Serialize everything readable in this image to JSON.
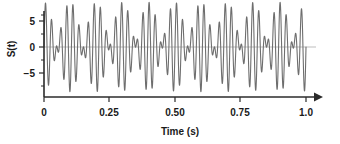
{
  "chart_data": {
    "type": "line",
    "title": "",
    "subtitle": "",
    "xlabel": "Time (s)",
    "ylabel": "S(t)",
    "xlim": [
      0,
      1.0
    ],
    "ylim": [
      -9.5,
      9.5
    ],
    "xticks": [
      0,
      0.25,
      0.5,
      0.75,
      1.0
    ],
    "xtick_labels": [
      "0",
      "0.25",
      "0.50",
      "0.75",
      "1.0"
    ],
    "yticks": [
      -5,
      0,
      5
    ],
    "ytick_labels": [
      "−5",
      "0",
      "5"
    ],
    "y_minor_ticks": [
      -7.5,
      -2.5,
      2.5,
      7.5
    ],
    "grid": false,
    "legend": null,
    "zero_line": true,
    "zero_line_color": "#b5b5b5",
    "line_color": "#6e6e6e",
    "axis_color": "#2b2b2b",
    "x_axis_arrow": true,
    "series": [
      {
        "name": "S(t)",
        "description": "Sum of two sinusoids producing a beat pattern",
        "formula": "S(t) = 4.3 sin(2π·38t) + 4.3 sin(2π·48t)",
        "components": [
          {
            "amplitude": 4.3,
            "frequency_hz": 38
          },
          {
            "amplitude": 4.3,
            "frequency_hz": 48
          }
        ],
        "beat_frequency_hz": 10,
        "envelope_period_s": 0.1,
        "peak_amplitude": 8.6,
        "min_amplitude": -8.6
      }
    ]
  }
}
